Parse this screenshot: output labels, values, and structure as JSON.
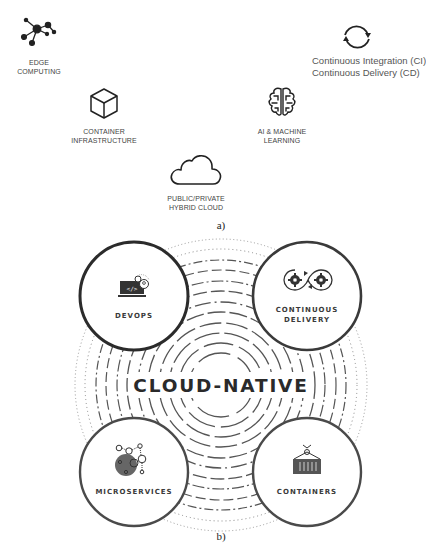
{
  "panel_a": {
    "caption": "a)",
    "items": [
      {
        "icon": "network-icon",
        "label_line1": "EDGE",
        "label_line2": "COMPUTING"
      },
      {
        "icon": "cycle-arrows-icon",
        "label_line1": "Continuous Integration (CI)",
        "label_line2": "Continuous Delivery (CD)"
      },
      {
        "icon": "cube-icon",
        "label_line1": "CONTAINER",
        "label_line2": "INFRASTRUCTURE"
      },
      {
        "icon": "brain-icon",
        "label_line1": "AI & MACHINE",
        "label_line2": "LEARNING"
      },
      {
        "icon": "cloud-icon",
        "label_line1": "PUBLIC/PRIVATE",
        "label_line2": "HYBRID CLOUD"
      }
    ]
  },
  "panel_b": {
    "caption": "b)",
    "center_title": "CLOUD-NATIVE",
    "nodes": [
      {
        "icon": "laptop-code-icon",
        "label_line1": "DEVOPS",
        "label_line2": ""
      },
      {
        "icon": "gears-infinity-icon",
        "label_line1": "CONTINUOUS",
        "label_line2": "DELIVERY"
      },
      {
        "icon": "microservices-bubbles-icon",
        "label_line1": "MICROSERVICES",
        "label_line2": ""
      },
      {
        "icon": "shipping-container-icon",
        "label_line1": "CONTAINERS",
        "label_line2": ""
      }
    ]
  },
  "colors": {
    "stroke": "#2b2b2b",
    "node_ring": "#3a3a3a",
    "dashed": "#555555",
    "dotted": "#888888",
    "fill_dark": "#555555"
  }
}
